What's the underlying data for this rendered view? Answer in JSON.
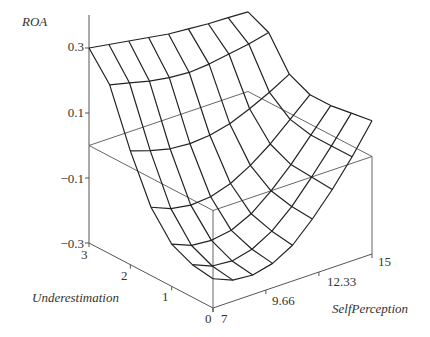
{
  "chart_data": {
    "type": "surface",
    "title": "",
    "zlabel": "ROA",
    "xlabel": "SelfPerception",
    "ylabel": "Underestimation",
    "z_ticks": [
      "0.3",
      "0.1",
      "−0.1",
      "−0.3"
    ],
    "z_tick_values": [
      0.3,
      0.1,
      -0.1,
      -0.3
    ],
    "x_ticks": [
      "7",
      "9.66",
      "12.33",
      "15"
    ],
    "x_tick_values": [
      7,
      9.66,
      12.33,
      15
    ],
    "y_ticks": [
      "0",
      "1",
      "2",
      "3"
    ],
    "y_tick_values": [
      0,
      1,
      2,
      3
    ],
    "zlim": [
      -0.3,
      0.3
    ],
    "xlim": [
      7,
      15
    ],
    "ylim": [
      0,
      3
    ],
    "grid": false,
    "floor_plane_z": 0,
    "S_values": [
      7,
      8,
      9,
      10,
      11,
      12,
      13,
      14,
      15
    ],
    "U_values": [
      0,
      0.5,
      1,
      1.5,
      2,
      2.5,
      3
    ],
    "Z_grid": [
      [
        -0.21,
        -0.235,
        -0.24,
        -0.225,
        -0.19,
        -0.13,
        -0.06,
        0.02,
        0.11
      ],
      [
        -0.2,
        -0.225,
        -0.23,
        -0.215,
        -0.18,
        -0.125,
        -0.055,
        0.02,
        0.1
      ],
      [
        -0.17,
        -0.195,
        -0.2,
        -0.19,
        -0.16,
        -0.11,
        -0.05,
        0.02,
        0.09
      ],
      [
        -0.09,
        -0.115,
        -0.125,
        -0.12,
        -0.1,
        -0.065,
        -0.02,
        0.035,
        0.09
      ],
      [
        0.05,
        0.03,
        0.015,
        0.01,
        0.015,
        0.03,
        0.055,
        0.085,
        0.12
      ],
      [
        0.22,
        0.205,
        0.19,
        0.18,
        0.175,
        0.18,
        0.19,
        0.2,
        0.215
      ],
      [
        0.3,
        0.29,
        0.28,
        0.27,
        0.26,
        0.255,
        0.25,
        0.248,
        0.245
      ]
    ]
  }
}
